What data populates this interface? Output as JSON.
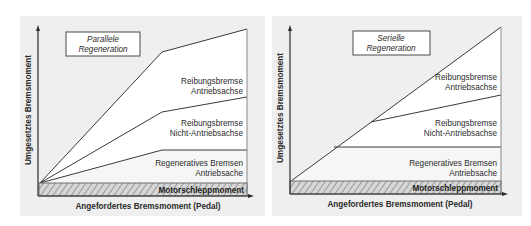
{
  "colors": {
    "panel_background": "#efefef",
    "region_fill": "#ffffff",
    "line": "#3a3a3a",
    "hatch_dark": "#9a9a9a",
    "hatch_light": "#d6d6d6"
  },
  "diagrams": [
    {
      "id": "parallel",
      "title_line1": "Parallele",
      "title_line2": "Regeneration",
      "y_axis_label": "Umgesetztes Bremsmoment",
      "x_axis_label": "Angefordertes Bremsmoment (Pedal)",
      "regions": {
        "friction_drive_axle": {
          "line1": "Reibungsbremse",
          "line2": "Antriebsachse"
        },
        "friction_non_drive_axle": {
          "line1": "Reibungsbremse",
          "line2": "Nicht-Antriebsachse"
        },
        "regenerative": {
          "line1": "Regeneratives Bremsen",
          "line2": "Antriebsache"
        },
        "engine_drag": "Motorschleppmoment"
      }
    },
    {
      "id": "serial",
      "title_line1": "Serielle",
      "title_line2": "Regeneration",
      "y_axis_label": "Umgesetztes Bremsmoment",
      "x_axis_label": "Angefordertes Bremsmoment (Pedal)",
      "regions": {
        "friction_drive_axle": {
          "line1": "Reibungsbremse",
          "line2": "Antriebsachse"
        },
        "friction_non_drive_axle": {
          "line1": "Reibungsbremse",
          "line2": "Nicht-Antriebsachse"
        },
        "regenerative": {
          "line1": "Regeneratives Bremsen",
          "line2": "Antriebsache"
        },
        "engine_drag": "Motorschleppmoment"
      }
    }
  ]
}
